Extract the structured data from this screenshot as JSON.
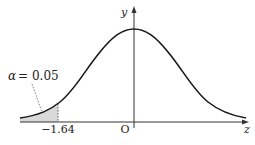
{
  "diagram": {
    "type": "normal-distribution-curve",
    "axes": {
      "x_label": "z",
      "y_label": "y",
      "origin_label": "O"
    },
    "shaded_region": {
      "label": "α = 0.05",
      "alpha_symbol": "α",
      "alpha_value": "= 0.05",
      "cutoff_label": "−1.64",
      "side": "left"
    },
    "colors": {
      "curve": "#1a1a1a",
      "shade": "#d9d9d9",
      "axis": "#333333"
    }
  }
}
